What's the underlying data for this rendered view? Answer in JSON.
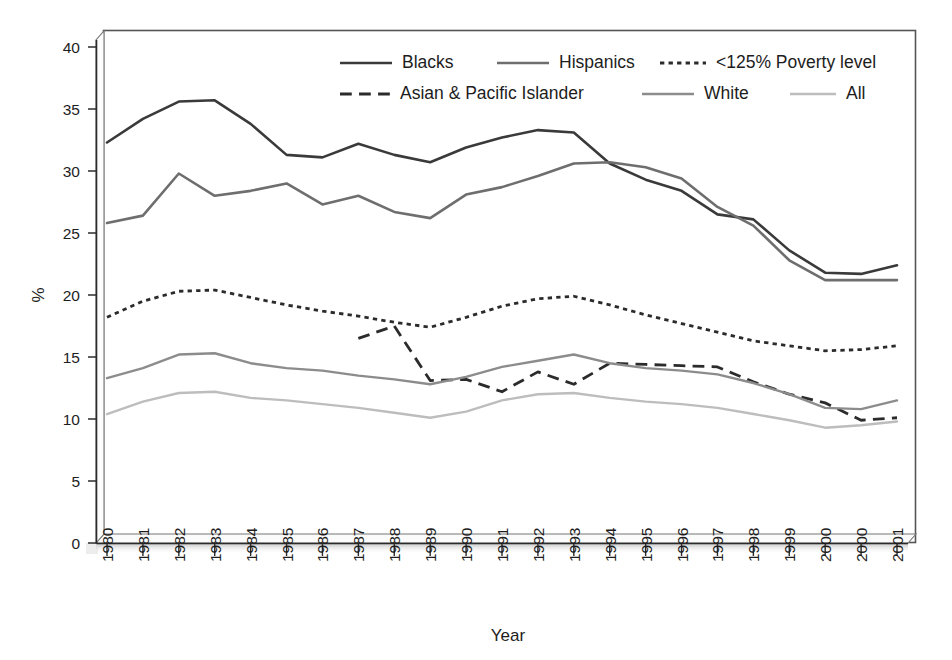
{
  "chart_data": {
    "type": "line",
    "title": "",
    "xlabel": "Year",
    "ylabel": "%",
    "ylim": [
      0,
      40
    ],
    "yticks": [
      0,
      5,
      10,
      15,
      20,
      25,
      30,
      35,
      40
    ],
    "grid": false,
    "legend_position": "top-center-inside",
    "categories": [
      "1980",
      "1981",
      "1982",
      "1983",
      "1984",
      "1985",
      "1986",
      "1987",
      "1988",
      "1989",
      "1990",
      "1991",
      "1992",
      "1993",
      "1994",
      "1995",
      "1996",
      "1997",
      "1998",
      "1999",
      "2000",
      "2000",
      "2001"
    ],
    "x": [
      "1980",
      "1981",
      "1982",
      "1983",
      "1984",
      "1985",
      "1986",
      "1987",
      "1988",
      "1989",
      "1990",
      "1991",
      "1992",
      "1993",
      "1994",
      "1995",
      "1996",
      "1997",
      "1998",
      "1999",
      "2000",
      "2000",
      "2001"
    ],
    "series": [
      {
        "name": "Blacks",
        "color": "#3a3a3a",
        "style": "solid",
        "width": 2.6,
        "values": [
          32.3,
          34.2,
          35.6,
          35.7,
          33.8,
          31.3,
          31.1,
          32.2,
          31.3,
          30.7,
          31.9,
          32.7,
          33.3,
          33.1,
          30.6,
          29.3,
          28.4,
          26.5,
          26.1,
          23.6,
          21.8,
          21.7,
          22.4
        ]
      },
      {
        "name": "Hispanics",
        "color": "#6e6e6e",
        "style": "solid",
        "width": 2.6,
        "values": [
          25.8,
          26.4,
          29.8,
          28.0,
          28.4,
          29.0,
          27.3,
          28.0,
          26.7,
          26.2,
          28.1,
          28.7,
          29.6,
          30.6,
          30.7,
          30.3,
          29.4,
          27.1,
          25.6,
          22.8,
          21.2,
          21.2,
          21.2
        ]
      },
      {
        "name": "<125% Poverty level",
        "color": "#2b2b2b",
        "style": "dotted",
        "width": 2.8,
        "values": [
          18.2,
          19.5,
          20.3,
          20.4,
          19.8,
          19.2,
          18.7,
          18.3,
          17.8,
          17.4,
          18.2,
          19.1,
          19.7,
          19.9,
          19.2,
          18.4,
          17.7,
          17.0,
          16.3,
          15.9,
          15.5,
          15.6,
          15.9
        ]
      },
      {
        "name": "Asian & Pacific Islander",
        "color": "#2b2b2b",
        "style": "dashed",
        "width": 2.8,
        "start_index": 7,
        "values": [
          null,
          null,
          null,
          null,
          null,
          null,
          null,
          16.5,
          17.5,
          13.1,
          13.2,
          12.2,
          13.8,
          12.8,
          14.5,
          14.4,
          14.3,
          14.2,
          13.0,
          12.0,
          11.3,
          9.9,
          10.1
        ]
      },
      {
        "name": "White",
        "color": "#8c8c8c",
        "style": "solid",
        "width": 2.4,
        "values": [
          13.3,
          14.1,
          15.2,
          15.3,
          14.5,
          14.1,
          13.9,
          13.5,
          13.2,
          12.8,
          13.4,
          14.2,
          14.7,
          15.2,
          14.5,
          14.1,
          13.9,
          13.6,
          12.9,
          12.0,
          10.9,
          10.8,
          11.5
        ]
      },
      {
        "name": "All",
        "color": "#bdbdbd",
        "style": "solid",
        "width": 2.4,
        "values": [
          10.4,
          11.4,
          12.1,
          12.2,
          11.7,
          11.5,
          11.2,
          10.9,
          10.5,
          10.1,
          10.6,
          11.5,
          12.0,
          12.1,
          11.7,
          11.4,
          11.2,
          10.9,
          10.4,
          9.9,
          9.3,
          9.5,
          9.8
        ]
      }
    ]
  },
  "legend": {
    "rows": [
      [
        {
          "label": "Blacks",
          "style": "solid",
          "color": "#3a3a3a"
        },
        {
          "label": "Hispanics",
          "style": "solid",
          "color": "#6e6e6e"
        },
        {
          "label": "<125% Poverty level",
          "style": "dotted",
          "color": "#2b2b2b"
        }
      ],
      [
        {
          "label": "Asian & Pacific Islander",
          "style": "dashed",
          "color": "#2b2b2b"
        },
        {
          "label": "White",
          "style": "solid",
          "color": "#8c8c8c"
        },
        {
          "label": "All",
          "style": "solid",
          "color": "#bdbdbd"
        }
      ]
    ]
  },
  "axes": {
    "y_title": "%",
    "x_title": "Year",
    "y_tick_labels": [
      "0",
      "5",
      "10",
      "15",
      "20",
      "25",
      "30",
      "35",
      "40"
    ],
    "x_tick_labels": [
      "1980",
      "1981",
      "1982",
      "1983",
      "1984",
      "1985",
      "1986",
      "1987",
      "1988",
      "1989",
      "1990",
      "1991",
      "1992",
      "1993",
      "1994",
      "1995",
      "1996",
      "1997",
      "1998",
      "1999",
      "2000",
      "2000",
      "2001"
    ]
  },
  "colors": {
    "frame": "#4a4a4a",
    "axis": "#2b2b2b",
    "background": "#ffffff",
    "base_shadow": "#c9c9c9"
  }
}
